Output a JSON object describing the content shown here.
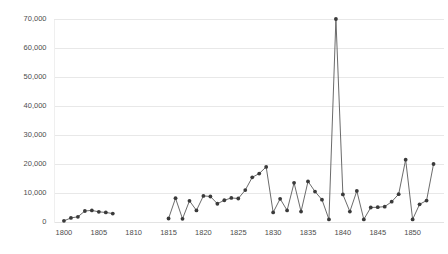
{
  "chart_data": {
    "type": "line",
    "title": "",
    "subtitle": "",
    "xlabel": "",
    "ylabel": "",
    "xlim": [
      1798.5,
      1854.5
    ],
    "ylim": [
      0,
      72000
    ],
    "grid": true,
    "grid_axis": "y",
    "legend": false,
    "legend_position": "none",
    "marker": "circle",
    "marker_color": "#3a3a3a",
    "line_color": "#5a5a5a",
    "gridline_color": "#e8e8e8",
    "background_color": "#ffffff",
    "y_ticks": [
      0,
      10000,
      20000,
      30000,
      40000,
      50000,
      60000,
      70000
    ],
    "y_tick_labels": [
      "0",
      "10,000",
      "20,000",
      "30,000",
      "40,000",
      "50,000",
      "60,000",
      "70,000"
    ],
    "x_ticks": [
      1800,
      1805,
      1810,
      1815,
      1820,
      1825,
      1830,
      1835,
      1840,
      1845,
      1850
    ],
    "x_tick_labels": [
      "1800",
      "1805",
      "1810",
      "1815",
      "1820",
      "1825",
      "1830",
      "1835",
      "1840",
      "1845",
      "1850"
    ],
    "series": [
      {
        "name": "segment-1",
        "x": [
          1800,
          1801,
          1802,
          1803,
          1804,
          1805,
          1806,
          1807
        ],
        "values": [
          400,
          1400,
          1800,
          3800,
          4000,
          3500,
          3300,
          2900
        ]
      },
      {
        "name": "segment-2",
        "x": [
          1815,
          1816,
          1817,
          1818,
          1819,
          1820,
          1821,
          1822,
          1823,
          1824,
          1825,
          1826,
          1827,
          1828,
          1829,
          1830,
          1831,
          1832,
          1833,
          1834,
          1835,
          1836,
          1837,
          1838,
          1839,
          1840,
          1841,
          1842,
          1843,
          1844,
          1845,
          1846,
          1847,
          1848,
          1849,
          1850,
          1851,
          1852,
          1853
        ],
        "values": [
          1200,
          8200,
          1100,
          7300,
          4000,
          9000,
          8800,
          6300,
          7500,
          8300,
          8100,
          11000,
          15400,
          16700,
          19000,
          3300,
          8000,
          4000,
          13500,
          3600,
          14000,
          10500,
          7700,
          900,
          70000,
          9500,
          3600,
          10700,
          900,
          5000,
          5100,
          5300,
          7000,
          9600,
          21500,
          900,
          6100,
          7400,
          20000
        ]
      }
    ]
  },
  "axes": {
    "y_axis_name": "y-axis",
    "x_axis_name": "x-axis"
  }
}
